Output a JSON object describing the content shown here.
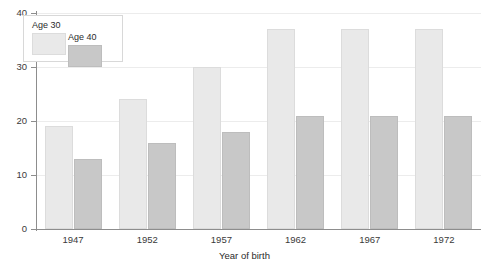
{
  "chart_data": {
    "type": "bar",
    "title": "",
    "xlabel": "Year of birth",
    "ylabel": "",
    "categories": [
      "1947",
      "1952",
      "1957",
      "1962",
      "1967",
      "1972"
    ],
    "series": [
      {
        "name": "Age 30",
        "values": [
          19,
          24,
          30,
          37,
          37,
          37
        ],
        "color": "#e9e9e9"
      },
      {
        "name": "Age 40",
        "values": [
          13,
          16,
          18,
          21,
          21,
          21
        ],
        "color": "#c8c8c8"
      }
    ],
    "ylim": [
      0,
      40
    ],
    "yticks": [
      0,
      10,
      20,
      30,
      40
    ],
    "ytick_labels": [
      "0",
      "10",
      "20",
      "30",
      "40"
    ],
    "grid": true,
    "legend_position": "top-left",
    "legend_entries": [
      "Age 30",
      "Age 40"
    ]
  }
}
